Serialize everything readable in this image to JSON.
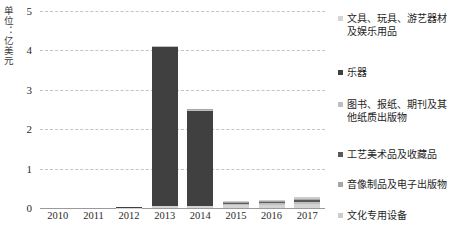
{
  "chart_data": {
    "type": "bar",
    "stacked": true,
    "title": "",
    "subtitle": "",
    "xlabel": "",
    "ylabel": "单位：亿美元",
    "ylim": [
      0,
      5
    ],
    "yticks": [
      "0",
      "1",
      "2",
      "3",
      "4",
      "5"
    ],
    "grid": true,
    "legend_position": "right",
    "categories": [
      "2010",
      "2011",
      "2012",
      "2013",
      "2014",
      "2015",
      "2016",
      "2017"
    ],
    "series": [
      {
        "name": "文具、玩具、游艺器材及娱乐用品",
        "color": "#d4d4d4",
        "values": [
          0.0,
          0.0,
          0.01,
          0.04,
          0.05,
          0.07,
          0.08,
          0.1
        ]
      },
      {
        "name": "乐器",
        "color": "#404040",
        "values": [
          0.0,
          0.0,
          0.01,
          4.05,
          2.4,
          0.0,
          0.0,
          0.0
        ]
      },
      {
        "name": "图书、报纸、期刊及其他纸质出版物",
        "color": "#bfbfbf",
        "values": [
          0.0,
          0.0,
          0.0,
          0.02,
          0.03,
          0.04,
          0.05,
          0.06
        ]
      },
      {
        "name": "工艺美术品及收藏品",
        "color": "#595959",
        "values": [
          0.0,
          0.0,
          0.0,
          0.01,
          0.02,
          0.02,
          0.03,
          0.04
        ]
      },
      {
        "name": "音像制品及电子出版物",
        "color": "#a6a6a6",
        "values": [
          0.0,
          0.0,
          0.0,
          0.0,
          0.01,
          0.02,
          0.02,
          0.03
        ]
      },
      {
        "name": "文化专用设备",
        "color": "#cccccc",
        "values": [
          0.0,
          0.0,
          0.0,
          0.0,
          0.01,
          0.02,
          0.03,
          0.04
        ]
      }
    ],
    "totals": [
      0.0,
      0.0,
      0.02,
      4.12,
      2.52,
      0.17,
      0.21,
      0.27
    ]
  },
  "legend": {
    "items": [
      {
        "label": "文具、玩具、游艺器材及娱乐用品",
        "color": "#d4d4d4"
      },
      {
        "label": "乐器",
        "color": "#404040"
      },
      {
        "label": "图书、报纸、期刊及其他纸质出版物",
        "color": "#bfbfbf"
      },
      {
        "label": "工艺美术品及收藏品",
        "color": "#595959"
      },
      {
        "label": "音像制品及电子出版物",
        "color": "#a6a6a6"
      },
      {
        "label": "文化专用设备",
        "color": "#cccccc"
      }
    ]
  }
}
